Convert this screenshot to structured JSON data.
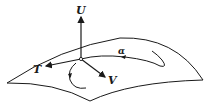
{
  "diagram": {
    "labels": {
      "normal": "U",
      "tangent": "T",
      "binormal": "V",
      "curve": "α"
    },
    "colors": {
      "stroke": "#1a1a1a",
      "background": "#ffffff"
    }
  }
}
